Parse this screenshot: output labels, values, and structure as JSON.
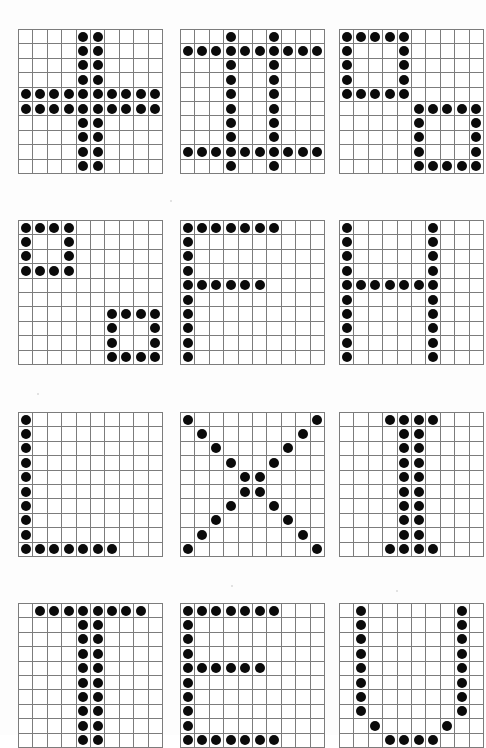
{
  "page": {
    "background_color": "#ffffff",
    "grid_line_color": "#7c7c7c",
    "dot_color": "#0a0a0a",
    "columns": 3,
    "rows": 4,
    "grid_size": 10,
    "cell_px": 13.4,
    "dot_diameter_px": 10
  },
  "grids": [
    {
      "id": "grid-1",
      "name": "plus-cross",
      "label": "+",
      "rows": 10,
      "cols": 10,
      "left": 18,
      "top": 29,
      "pattern": [
        "0000110000",
        "0000110000",
        "0000110000",
        "0000110000",
        "1111111111",
        "1111111111",
        "0000110000",
        "0000110000",
        "0000110000",
        "0000110000"
      ]
    },
    {
      "id": "grid-2",
      "name": "hash-grid",
      "label": "#",
      "rows": 10,
      "cols": 10,
      "left": 180,
      "top": 29,
      "pattern": [
        "0001001000",
        "1111111111",
        "0001001000",
        "0001001000",
        "0001001000",
        "0001001000",
        "0001001000",
        "0001001000",
        "1111111111",
        "0001001000"
      ]
    },
    {
      "id": "grid-3",
      "name": "two-boxes-5x5",
      "label": "boxes",
      "rows": 10,
      "cols": 10,
      "left": 339,
      "top": 29,
      "pattern": [
        "1111100000",
        "1000100000",
        "1000100000",
        "1000100000",
        "1111100000",
        "0000011111",
        "0000010001",
        "0000010001",
        "0000010001",
        "0000011111"
      ]
    },
    {
      "id": "grid-4",
      "name": "two-boxes-4x4",
      "label": "boxes",
      "rows": 10,
      "cols": 10,
      "left": 18,
      "top": 220,
      "pattern": [
        "1111000000",
        "1001000000",
        "1001000000",
        "1111000000",
        "0000000000",
        "0000000000",
        "0000001111",
        "0000001001",
        "0000001001",
        "0000001111"
      ]
    },
    {
      "id": "grid-5",
      "name": "letter-f",
      "label": "F",
      "rows": 10,
      "cols": 10,
      "left": 180,
      "top": 220,
      "pattern": [
        "1111111000",
        "1000000000",
        "1000000000",
        "1000000000",
        "1111110000",
        "1000000000",
        "1000000000",
        "1000000000",
        "1000000000",
        "1000000000"
      ]
    },
    {
      "id": "grid-6",
      "name": "letter-h",
      "label": "H",
      "rows": 10,
      "cols": 10,
      "left": 339,
      "top": 220,
      "pattern": [
        "1000001000",
        "1000001000",
        "1000001000",
        "1000001000",
        "1111111000",
        "1000001000",
        "1000001000",
        "1000001000",
        "1000001000",
        "1000001000"
      ]
    },
    {
      "id": "grid-7",
      "name": "letter-l",
      "label": "L",
      "rows": 10,
      "cols": 10,
      "left": 18,
      "top": 412,
      "pattern": [
        "1000000000",
        "1000000000",
        "1000000000",
        "1000000000",
        "1000000000",
        "1000000000",
        "1000000000",
        "1000000000",
        "1000000000",
        "1111111000"
      ]
    },
    {
      "id": "grid-8",
      "name": "letter-x",
      "label": "X",
      "rows": 10,
      "cols": 10,
      "left": 180,
      "top": 412,
      "pattern": [
        "1000000001",
        "0100000010",
        "0010000100",
        "0001001000",
        "0000110000",
        "0000110000",
        "0001001000",
        "0010000100",
        "0100000010",
        "1000000001"
      ]
    },
    {
      "id": "grid-9",
      "name": "letter-i",
      "label": "I",
      "rows": 10,
      "cols": 10,
      "left": 339,
      "top": 412,
      "pattern": [
        "0001111000",
        "0000110000",
        "0000110000",
        "0000110000",
        "0000110000",
        "0000110000",
        "0000110000",
        "0000110000",
        "0000110000",
        "0001111000"
      ]
    },
    {
      "id": "grid-10",
      "name": "letter-t",
      "label": "T",
      "rows": 10,
      "cols": 10,
      "left": 18,
      "top": 603,
      "pattern": [
        "0111111110",
        "0000110000",
        "0000110000",
        "0000110000",
        "0000110000",
        "0000110000",
        "0000110000",
        "0000110000",
        "0000110000",
        "0000110000"
      ]
    },
    {
      "id": "grid-11",
      "name": "letter-e",
      "label": "E",
      "rows": 10,
      "cols": 10,
      "left": 180,
      "top": 603,
      "pattern": [
        "1111111000",
        "1000000000",
        "1000000000",
        "1000000000",
        "1111110000",
        "1000000000",
        "1000000000",
        "1000000000",
        "1000000000",
        "1111111000"
      ]
    },
    {
      "id": "grid-12",
      "name": "letter-u",
      "label": "U",
      "rows": 10,
      "cols": 10,
      "left": 339,
      "top": 603,
      "pattern": [
        "0100000010",
        "0100000010",
        "0100000010",
        "0100000010",
        "0100000010",
        "0100000010",
        "0100000010",
        "0100000010",
        "0010000100",
        "0001111000"
      ]
    }
  ],
  "specks": [
    {
      "left": 37,
      "top": 393,
      "size": 2
    },
    {
      "left": 396,
      "top": 590,
      "size": 2
    },
    {
      "left": 231,
      "top": 585,
      "size": 2
    },
    {
      "left": 170,
      "top": 200,
      "size": 2
    }
  ]
}
